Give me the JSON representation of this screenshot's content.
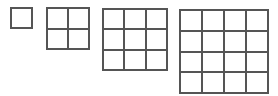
{
  "diagram": {
    "title": "",
    "line_color": "#555555",
    "grids": [
      {
        "name": "grid-1x1",
        "size": 1,
        "x": 10,
        "y": 7,
        "w": 23,
        "h": 22
      },
      {
        "name": "grid-2x2",
        "size": 2,
        "x": 46,
        "y": 7,
        "w": 44,
        "h": 43
      },
      {
        "name": "grid-3x3",
        "size": 3,
        "x": 102,
        "y": 8,
        "w": 66,
        "h": 63
      },
      {
        "name": "grid-4x4",
        "size": 4,
        "x": 179,
        "y": 9,
        "w": 90,
        "h": 85
      }
    ]
  }
}
